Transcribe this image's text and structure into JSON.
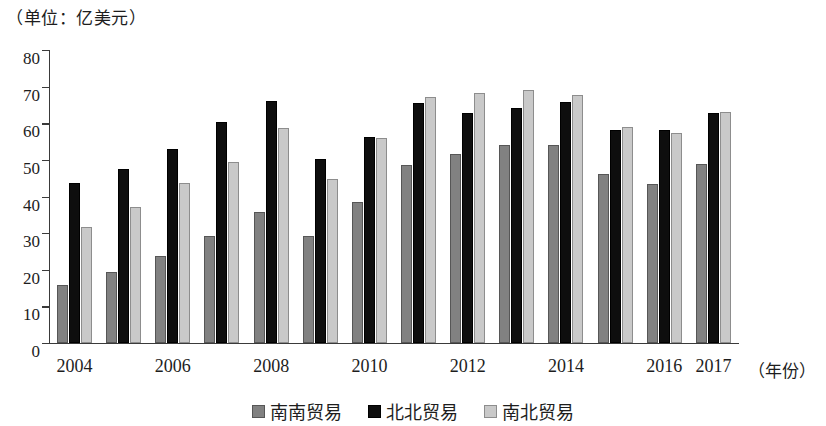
{
  "unit_caption": "（单位：亿美元）",
  "x_axis_title": "（年份）",
  "colors": {
    "series_south_south": "#818181",
    "series_north_north": "#0e0e0e",
    "series_south_north": "#c9c9c9",
    "axis": "#3a3a3a",
    "text": "#1d1d1d",
    "background": "#ffffff"
  },
  "y_axis": {
    "ticks": [
      "0",
      "10",
      "20",
      "30",
      "40",
      "50",
      "60",
      "70",
      "80"
    ],
    "min": 0,
    "max": 80,
    "step": 10
  },
  "x_axis": {
    "visible_labels": [
      "2004",
      "2006",
      "2008",
      "2010",
      "2012",
      "2014",
      "2016",
      "2017"
    ]
  },
  "legend": {
    "items": [
      {
        "label": "南南贸易",
        "swatch": "s0"
      },
      {
        "label": "北北贸易",
        "swatch": "s1"
      },
      {
        "label": "南北贸易",
        "swatch": "s2"
      }
    ]
  },
  "chart_data": {
    "type": "bar",
    "title": "",
    "subtitle": "",
    "xlabel": "（年份）",
    "ylabel": "（单位：亿美元）",
    "ylim": [
      0,
      80
    ],
    "ytick_step": 10,
    "grid": false,
    "legend_position": "bottom-center",
    "categories": [
      "2004",
      "2005",
      "2006",
      "2007",
      "2008",
      "2009",
      "2010",
      "2011",
      "2012",
      "2013",
      "2014",
      "2015",
      "2016",
      "2017"
    ],
    "labeled_categories": [
      "2004",
      "2006",
      "2008",
      "2010",
      "2012",
      "2014",
      "2016",
      "2017"
    ],
    "series": [
      {
        "name": "南南贸易",
        "color": "#818181",
        "values": [
          15.8,
          19.4,
          23.8,
          29.2,
          35.8,
          29.3,
          38.5,
          48.5,
          51.5,
          54.2,
          54.1,
          46.2,
          43.5,
          48.8
        ]
      },
      {
        "name": "北北贸易",
        "color": "#0e0e0e",
        "values": [
          43.7,
          47.4,
          53.1,
          60.3,
          66.1,
          50.3,
          56.2,
          65.6,
          62.9,
          64.3,
          65.8,
          58.2,
          58.1,
          62.8
        ]
      },
      {
        "name": "南北贸易",
        "color": "#c9c9c9",
        "values": [
          31.8,
          37.2,
          43.7,
          49.5,
          58.7,
          44.9,
          56.1,
          67.2,
          68.4,
          69.1,
          67.8,
          59.1,
          57.3,
          63.2
        ]
      }
    ]
  }
}
